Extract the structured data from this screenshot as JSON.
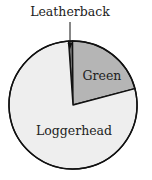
{
  "chart_data": {
    "type": "pie",
    "title": "",
    "slices": [
      {
        "label": "Leatherback",
        "value": 1,
        "color": "#6e6e6e"
      },
      {
        "label": "Green",
        "value": 21,
        "color": "#b5b5b5"
      },
      {
        "label": "Loggerhead",
        "value": 78,
        "color": "#eeeeee"
      }
    ],
    "labels": {
      "leatherback": "Leatherback",
      "green": "Green",
      "loggerhead": "Loggerhead"
    },
    "legend": "none",
    "annotations": [
      "Leatherback label with arrow pointer to thin slice at top"
    ]
  }
}
